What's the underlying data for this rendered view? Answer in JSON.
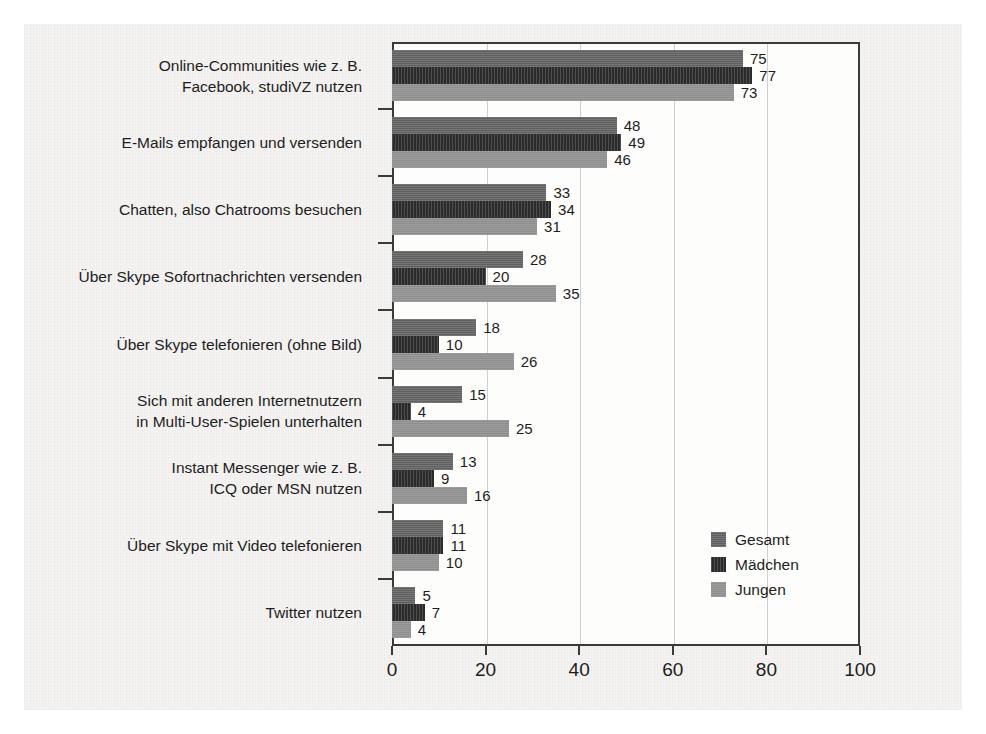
{
  "chart_data": {
    "type": "bar",
    "orientation": "horizontal",
    "title": "",
    "xlabel": "",
    "ylabel": "",
    "xlim": [
      0,
      100
    ],
    "xticks": [
      0,
      20,
      40,
      60,
      80,
      100
    ],
    "grid": true,
    "legend_position": "inside-bottom-right",
    "categories": [
      "Online-Communities wie z. B.\nFacebook, studiVZ nutzen",
      "E-Mails empfangen und versenden",
      "Chatten, also Chatrooms besuchen",
      "Über Skype Sofortnachrichten versenden",
      "Über Skype telefonieren (ohne Bild)",
      "Sich mit anderen Internetnutzern\nin Multi-User-Spielen unterhalten",
      "Instant Messenger wie z. B.\nICQ oder MSN nutzen",
      "Über Skype mit Video telefonieren",
      "Twitter nutzen"
    ],
    "series": [
      {
        "name": "Gesamt",
        "color": "#666666",
        "values": [
          75,
          48,
          33,
          28,
          18,
          15,
          13,
          11,
          5
        ]
      },
      {
        "name": "Mädchen",
        "color": "#2b2b2b",
        "values": [
          77,
          49,
          34,
          20,
          10,
          4,
          9,
          11,
          7
        ]
      },
      {
        "name": "Jungen",
        "color": "#949494",
        "values": [
          73,
          46,
          31,
          35,
          26,
          25,
          16,
          10,
          4
        ]
      }
    ]
  }
}
